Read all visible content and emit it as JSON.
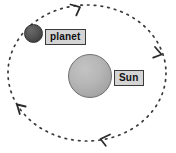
{
  "diagram": {
    "background_color": "#ffffff",
    "orbit": {
      "name": "orbit-path",
      "style": "dotted",
      "stroke_color": "#3a3a3a",
      "direction": "clockwise",
      "center_x": 87,
      "center_y": 73,
      "radius_x": 79,
      "radius_y": 68,
      "arrow_count": 4,
      "arrow_positions": [
        "top",
        "right",
        "bottom",
        "left"
      ]
    },
    "bodies": [
      {
        "id": "sun",
        "label": "Sun",
        "color": "#b6b6b6",
        "outline_color": "#6e6e6e",
        "center_x": 90,
        "center_y": 76,
        "diameter": 44
      },
      {
        "id": "planet",
        "label": "planet",
        "color": "#4a4a4a",
        "outline_color": "#2e2e2e",
        "center_x": 33,
        "center_y": 33,
        "diameter": 19
      }
    ],
    "labels": {
      "planet": "planet",
      "sun": "Sun",
      "box_fill": "#d4d4d4",
      "box_border": "#3a3a3a",
      "text_color": "#111111"
    }
  }
}
